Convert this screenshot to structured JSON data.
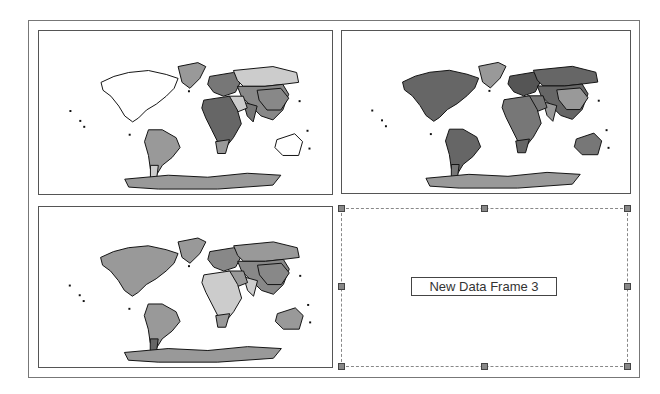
{
  "layout_view": {
    "data_frames": [
      {
        "name": "Data Frame 1",
        "palette": {
          "north_america": "#ffffff",
          "greenland": "#999999",
          "russia": "#cccccc",
          "europe": "#777777",
          "asia": "#888888",
          "china": "#888888",
          "india": "#777777",
          "middle_east": "#cccccc",
          "africa": "#666666",
          "south_africa": "#999999",
          "south_america": "#999999",
          "patagonia": "#cccccc",
          "australia": "#ffffff",
          "antarctica": "#999999"
        }
      },
      {
        "name": "Data Frame 2",
        "palette": {
          "north_america": "#666666",
          "greenland": "#999999",
          "russia": "#666666",
          "europe": "#555555",
          "asia": "#666666",
          "china": "#999999",
          "india": "#999999",
          "middle_east": "#777777",
          "africa": "#777777",
          "south_africa": "#666666",
          "south_america": "#666666",
          "patagonia": "#777777",
          "australia": "#777777",
          "antarctica": "#999999"
        }
      },
      {
        "name": "Data Frame 3 (existing)",
        "palette": {
          "north_america": "#999999",
          "greenland": "#999999",
          "russia": "#999999",
          "europe": "#888888",
          "asia": "#888888",
          "china": "#888888",
          "india": "#cccccc",
          "middle_east": "#999999",
          "africa": "#cccccc",
          "south_africa": "#999999",
          "south_america": "#999999",
          "patagonia": "#666666",
          "australia": "#999999",
          "antarctica": "#999999"
        }
      }
    ],
    "new_frame": {
      "label": "New Data Frame 3",
      "selected": true
    }
  }
}
